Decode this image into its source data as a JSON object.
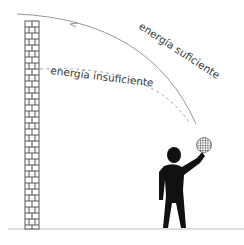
{
  "diagram": {
    "labels": {
      "sufficient": "energía suficiente",
      "insufficient": "energía insuficiente"
    },
    "colors": {
      "trajectory": "#8a8a8a",
      "wall_line": "#444444",
      "figure": "#111111",
      "ground": "#bbbbbb",
      "text": "#3a3a3a"
    }
  }
}
